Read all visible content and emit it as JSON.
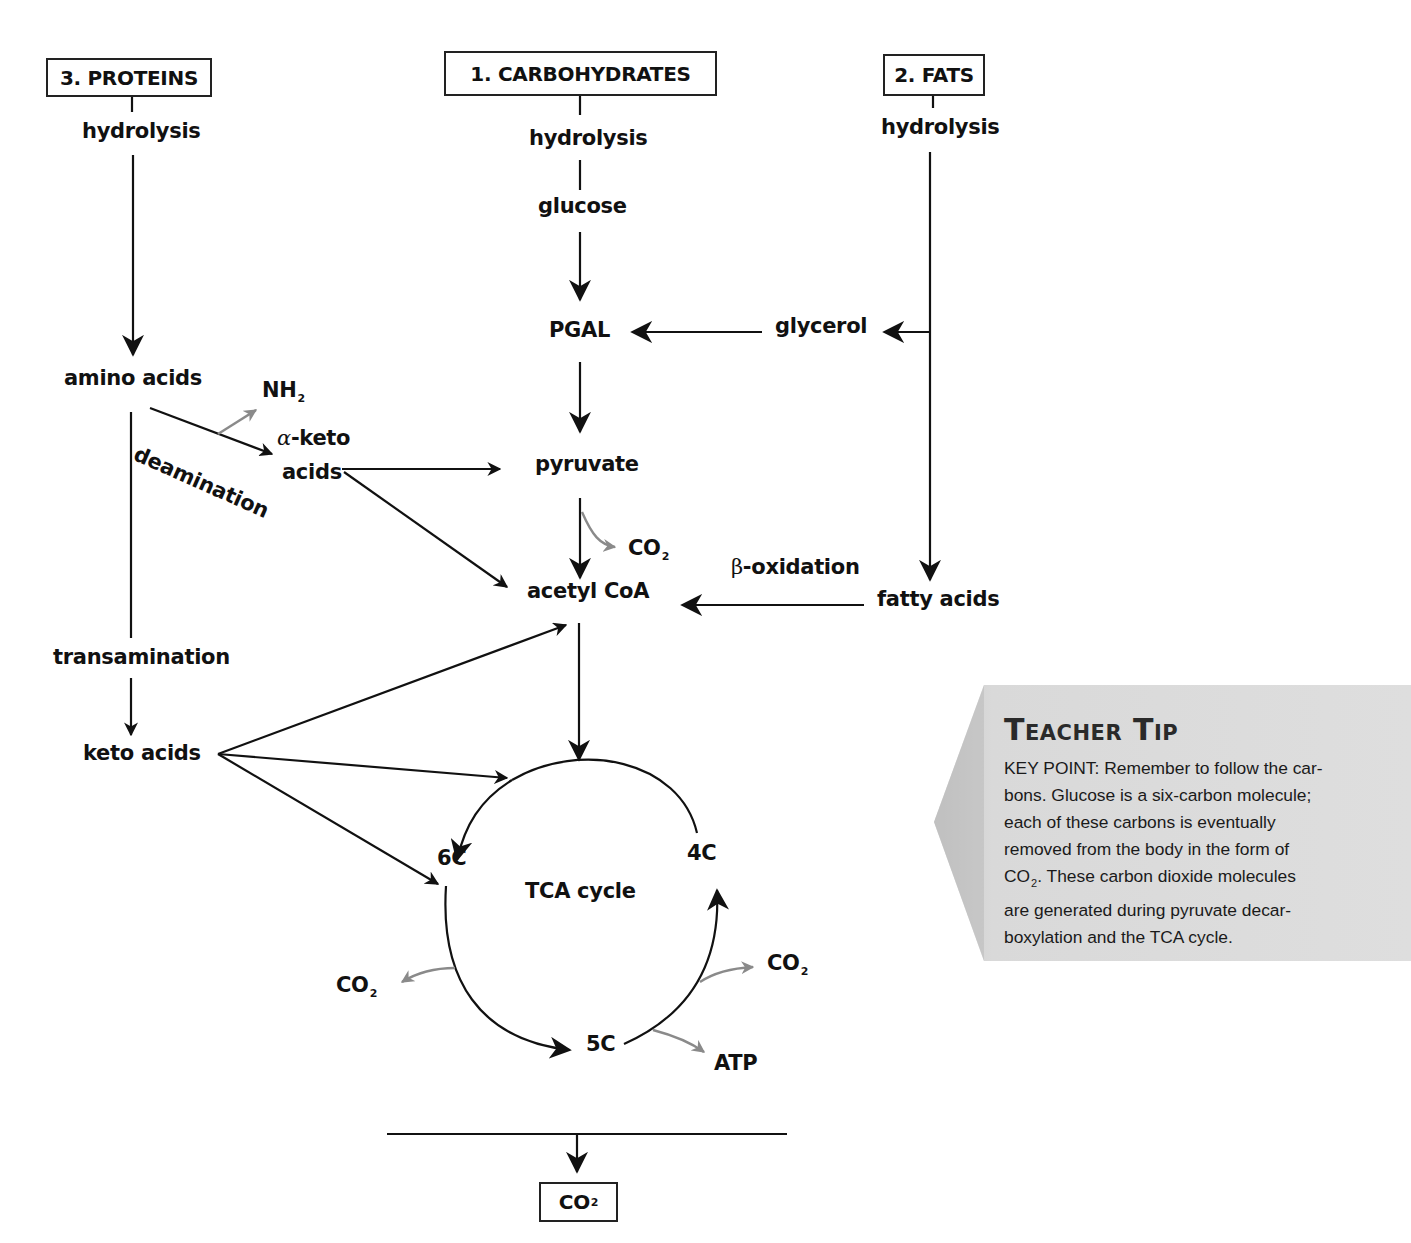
{
  "diagram": {
    "type": "metabolic-pathway",
    "sources": {
      "proteins": "3. PROTEINS",
      "carbohydrates": "1. CARBOHYDRATES",
      "fats": "2. FATS"
    },
    "nodes": {
      "proteins_hydrolysis": "hydrolysis",
      "carb_hydrolysis": "hydrolysis",
      "fats_hydrolysis": "hydrolysis",
      "glucose": "glucose",
      "pgal": "PGAL",
      "glycerol": "glycerol",
      "amino_acids": "amino acids",
      "nh2": "NH",
      "nh2_sub": "2",
      "deamination": "deamination",
      "alpha_symbol": "α",
      "alpha_keto": "-keto",
      "alpha_keto_acids": "acids",
      "pyruvate": "pyruvate",
      "co2_pyruvate": "CO",
      "acetyl_coa": "acetyl CoA",
      "beta_symbol": "β",
      "beta_oxidation": "-oxidation",
      "fatty_acids": "fatty acids",
      "transamination": "transamination",
      "keto_acids": "keto acids",
      "tca_cycle": "TCA cycle",
      "c6": "6C",
      "c4": "4C",
      "c5": "5C",
      "co2_left": "CO",
      "co2_right": "CO",
      "atp": "ATP",
      "co2_final": "CO",
      "sub2": "2"
    },
    "colors": {
      "arrow": "#111111",
      "byproduct_arrow": "#8a8a8a",
      "tip_background": "#dcdcdc"
    }
  },
  "teacher_tip": {
    "title": "Teacher Tip",
    "lines": [
      "KEY POINT: Remember to follow the car-",
      "bons. Glucose is a six-carbon molecule;",
      "each of these carbons is eventually",
      "removed from the body in the form of",
      "CO",
      "are generated during pyruvate decar-",
      "boxylation and the TCA cycle."
    ],
    "line5_sub": "2",
    "line5_rest": ". These carbon dioxide molecules"
  }
}
